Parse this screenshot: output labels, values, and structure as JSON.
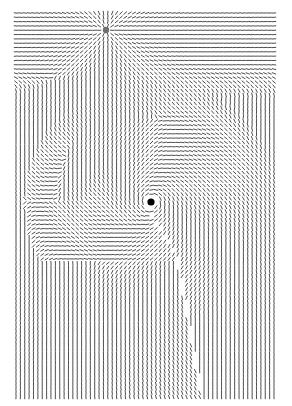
{
  "figure": {
    "width": 292,
    "height": 406,
    "background": "#ffffff",
    "stroke_color": "#3a3a3a",
    "plot_area": {
      "x0": 16,
      "y0": 13,
      "x1": 274,
      "y1": 397
    },
    "grid": {
      "cols": 60,
      "rows": 90
    },
    "segment_length": 3.6,
    "points": [
      {
        "name": "source-point",
        "x": 106,
        "y": 30,
        "r": 3.2,
        "color": "#6f6f6f"
      },
      {
        "name": "sink-point",
        "x": 151,
        "y": 202,
        "r": 3.6,
        "color": "#000000"
      }
    ],
    "seam": {
      "description": "discontinuity running from below center to bottom",
      "path": [
        [
          150,
          214
        ],
        [
          175,
          252
        ],
        [
          178,
          262
        ],
        [
          183,
          290
        ],
        [
          188,
          316
        ],
        [
          194,
          352
        ],
        [
          202,
          397
        ]
      ]
    }
  }
}
